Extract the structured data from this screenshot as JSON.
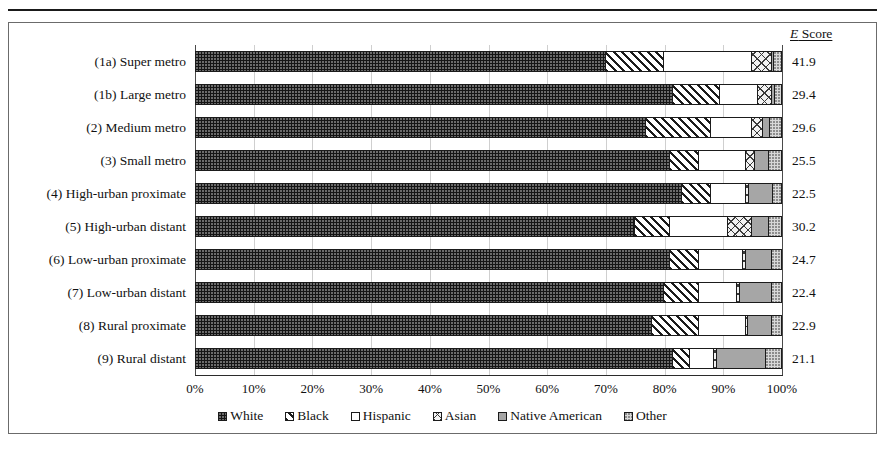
{
  "header": {
    "cropped_title": "",
    "escore_label_italic": "E",
    "escore_label_rest": " Score"
  },
  "chart_data": {
    "type": "bar",
    "subtype": "horizontal-stacked-100pct",
    "title": "",
    "xlabel": "",
    "ylabel": "",
    "xlim": [
      0,
      100
    ],
    "grid": true,
    "legend_position": "bottom",
    "xticks": [
      "0%",
      "10%",
      "20%",
      "30%",
      "40%",
      "50%",
      "60%",
      "70%",
      "80%",
      "90%",
      "100%"
    ],
    "xtick_values": [
      0,
      10,
      20,
      30,
      40,
      50,
      60,
      70,
      80,
      90,
      100
    ],
    "categories": [
      "(1a) Super metro",
      "(1b) Large metro",
      "(2) Medium metro",
      "(3) Small metro",
      "(4) High-urban proximate",
      "(5) High-urban distant",
      "(6) Low-urban proximate",
      "(7) Low-urban distant",
      "(8) Rural proximate",
      "(9) Rural distant"
    ],
    "series": [
      {
        "name": "White",
        "pattern": "dark-dotted",
        "values": [
          70.0,
          81.5,
          77.0,
          81.0,
          83.0,
          75.0,
          81.0,
          80.0,
          78.0,
          81.5
        ]
      },
      {
        "name": "Black",
        "pattern": "diagonal-hatch",
        "values": [
          10.0,
          8.0,
          11.0,
          5.0,
          5.0,
          6.0,
          5.0,
          6.0,
          8.0,
          3.0
        ]
      },
      {
        "name": "Hispanic",
        "pattern": "white",
        "values": [
          15.0,
          6.5,
          7.0,
          8.0,
          6.0,
          10.0,
          7.5,
          6.5,
          8.0,
          4.0
        ]
      },
      {
        "name": "Asian",
        "pattern": "cross-hatch",
        "values": [
          3.5,
          2.5,
          2.0,
          1.5,
          0.6,
          4.0,
          0.5,
          0.5,
          0.4,
          0.5
        ]
      },
      {
        "name": "Native American",
        "pattern": "solid-gray",
        "values": [
          0.3,
          0.4,
          1.2,
          2.5,
          4.0,
          3.0,
          4.5,
          5.5,
          4.0,
          8.5
        ]
      },
      {
        "name": "Other",
        "pattern": "light-dotted",
        "values": [
          1.2,
          1.1,
          1.8,
          2.0,
          1.4,
          2.0,
          1.5,
          1.5,
          1.6,
          2.5
        ]
      }
    ],
    "escore_label": "E Score",
    "escores": [
      "41.9",
      "29.4",
      "29.6",
      "25.5",
      "22.5",
      "30.2",
      "24.7",
      "22.4",
      "22.9",
      "21.1"
    ]
  },
  "legend": {
    "items": [
      {
        "label": "White",
        "pattern": "dark-dotted"
      },
      {
        "label": "Black",
        "pattern": "diagonal-hatch"
      },
      {
        "label": "Hispanic",
        "pattern": "white"
      },
      {
        "label": "Asian",
        "pattern": "cross-hatch"
      },
      {
        "label": "Native American",
        "pattern": "solid-gray"
      },
      {
        "label": "Other",
        "pattern": "light-dotted"
      }
    ]
  },
  "colors": {
    "white_series": "#151515",
    "black_series": "#1b1b1b",
    "hispanic_series": "#ffffff",
    "asian_series": "#f2f2f2",
    "native_series": "#a6a6a6",
    "other_series": "#d8d8d8",
    "axis": "#2b2b2b",
    "gridline": "#cfcfcf"
  }
}
